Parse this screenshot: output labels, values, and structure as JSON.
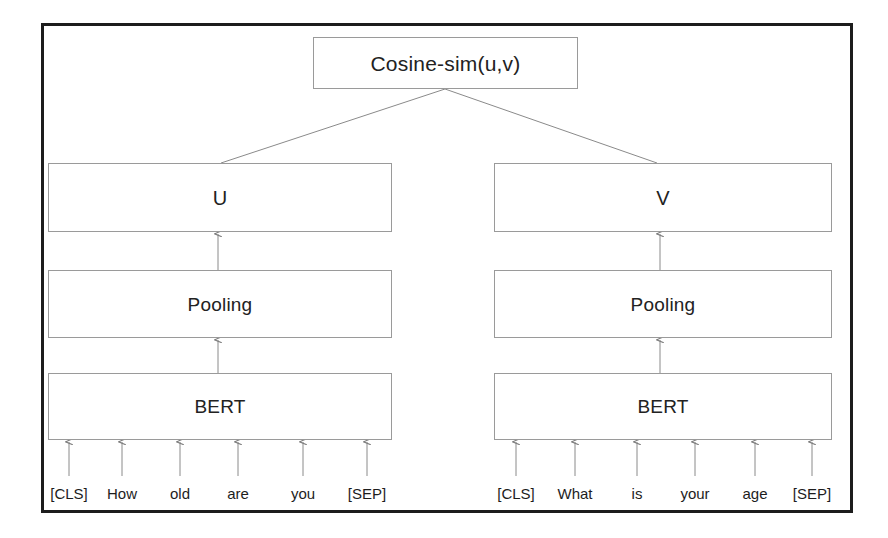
{
  "figure": {
    "frame_color": "#1d1d1d",
    "box_border_color": "#9a9a9a",
    "connector_color": "#7d7d7d",
    "background": "#ffffff"
  },
  "nodes": {
    "cosine": {
      "label": "Cosine-sim(u,v)"
    },
    "u": {
      "label": "U"
    },
    "v": {
      "label": "V"
    },
    "pooling_left": {
      "label": "Pooling"
    },
    "pooling_right": {
      "label": "Pooling"
    },
    "bert_left": {
      "label": "BERT"
    },
    "bert_right": {
      "label": "BERT"
    }
  },
  "inputs": {
    "left": {
      "tokens": [
        "[CLS]",
        "How",
        "old",
        "are",
        "you",
        "[SEP]"
      ],
      "x_positions": [
        69,
        122,
        180,
        238,
        303,
        367
      ]
    },
    "right": {
      "tokens": [
        "[CLS]",
        "What",
        "is",
        "your",
        "age",
        "[SEP]"
      ],
      "x_positions": [
        516,
        575,
        637,
        695,
        755,
        812
      ]
    }
  }
}
